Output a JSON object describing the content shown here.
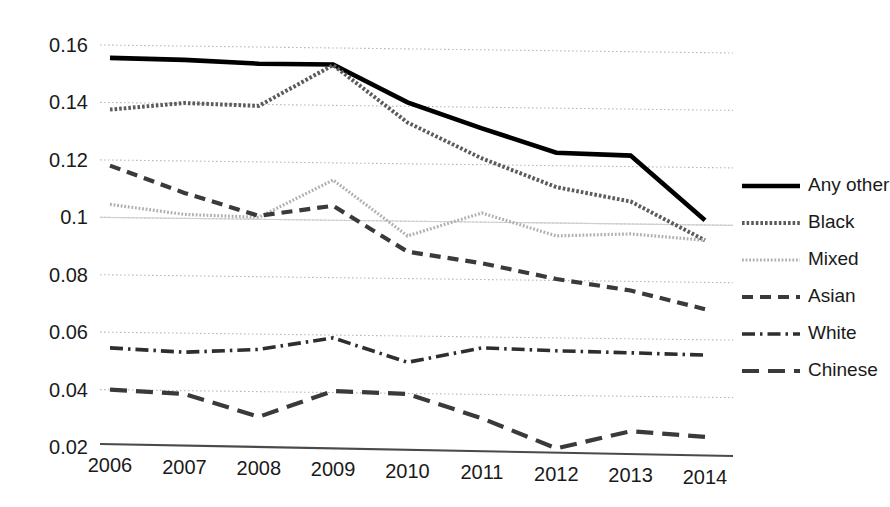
{
  "chart_data": {
    "type": "line",
    "title": "",
    "subtitle": "",
    "xlabel": "",
    "ylabel": "",
    "categories": [
      "2006",
      "2007",
      "2008",
      "2009",
      "2010",
      "2011",
      "2012",
      "2013",
      "2014"
    ],
    "x": [
      2006,
      2007,
      2008,
      2009,
      2010,
      2011,
      2012,
      2013,
      2014
    ],
    "xlim": [
      2006,
      2014
    ],
    "ylim": [
      0.02,
      0.16
    ],
    "y_ticks": [
      0.02,
      0.04,
      0.06,
      0.08,
      0.1,
      0.12,
      0.14,
      0.16
    ],
    "y_tick_labels": [
      "0.02",
      "0.04",
      "0.06",
      "0.08",
      "0.1",
      "0.12",
      "0.14",
      "0.16"
    ],
    "x_tick_labels": [
      "2006",
      "2007",
      "2008",
      "2009",
      "2010",
      "2011",
      "2012",
      "2013",
      "2014"
    ],
    "grid": true,
    "grid_axis": "y",
    "legend_position": "right",
    "series": [
      {
        "name": "Any other",
        "color": "#000000",
        "line_style": "solid",
        "line_width": 4.6,
        "values": [
          0.1555,
          0.1548,
          0.1535,
          0.1532,
          0.14,
          0.131,
          0.1225,
          0.1215,
          0.099
        ]
      },
      {
        "name": "Black",
        "color": "#5b5b5b",
        "line_style": "dotted-dense",
        "line_width": 4.0,
        "values": [
          0.1375,
          0.1398,
          0.1388,
          0.153,
          0.133,
          0.1205,
          0.1105,
          0.1055,
          0.092
        ]
      },
      {
        "name": "Mixed",
        "color": "#b0b0b0",
        "line_style": "dotted-fine",
        "line_width": 3.2,
        "values": [
          0.1045,
          0.101,
          0.1,
          0.113,
          0.0935,
          0.1015,
          0.0935,
          0.0942,
          0.092
        ]
      },
      {
        "name": "Asian",
        "color": "#3a3a3a",
        "line_style": "dashed",
        "line_width": 4.2,
        "values": [
          0.118,
          0.1085,
          0.1005,
          0.104,
          0.088,
          0.084,
          0.0785,
          0.0745,
          0.068
        ]
      },
      {
        "name": "White",
        "color": "#2e2e2e",
        "line_style": "dash-dot",
        "line_width": 3.6,
        "values": [
          0.0545,
          0.053,
          0.054,
          0.058,
          0.0495,
          0.0545,
          0.0535,
          0.0528,
          0.052
        ]
      },
      {
        "name": "Chinese",
        "color": "#3a3a3a",
        "line_style": "long-dash",
        "line_width": 4.2,
        "values": [
          0.04,
          0.0385,
          0.0305,
          0.0395,
          0.0385,
          0.03,
          0.0195,
          0.0255,
          0.0235
        ]
      }
    ]
  },
  "legend": {
    "items": [
      {
        "label": "Any other"
      },
      {
        "label": "Black"
      },
      {
        "label": "Mixed"
      },
      {
        "label": "Asian"
      },
      {
        "label": "White"
      },
      {
        "label": "Chinese"
      }
    ]
  }
}
